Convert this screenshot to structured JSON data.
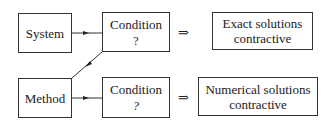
{
  "diagram": {
    "nodes": {
      "system": {
        "label": "System"
      },
      "method": {
        "label": "Method"
      },
      "condition_top": {
        "label": "Condition",
        "mark": "?"
      },
      "condition_bottom": {
        "label": "Condition",
        "mark": "?"
      },
      "exact": {
        "line1": "Exact solutions",
        "line2": "contractive"
      },
      "numerical": {
        "line1": "Numerical solutions",
        "line2": "contractive"
      }
    },
    "implies_symbol": "⇒",
    "edges": [
      {
        "from": "system",
        "to": "condition_top",
        "type": "arrow"
      },
      {
        "from": "condition_top",
        "to": "method",
        "type": "arrow"
      },
      {
        "from": "method",
        "to": "condition_bottom",
        "type": "arrow"
      },
      {
        "from": "condition_top",
        "to": "exact",
        "type": "implies"
      },
      {
        "from": "condition_bottom",
        "to": "numerical",
        "type": "implies"
      }
    ]
  }
}
